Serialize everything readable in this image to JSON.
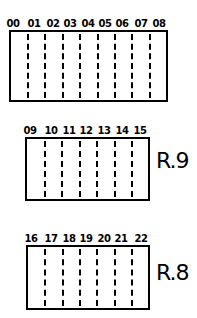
{
  "blocks": [
    {
      "id": "top",
      "box": {
        "left": 9,
        "top": 30,
        "width": 159,
        "height": 72
      },
      "cells": [
        "00",
        "01",
        "02",
        "03",
        "04",
        "05",
        "06",
        "07",
        "08"
      ],
      "label_positions": [
        13,
        34,
        53,
        70,
        88,
        105,
        122,
        141,
        159
      ],
      "dividers": [
        26,
        43,
        61,
        78,
        96,
        113,
        130,
        148
      ],
      "row_label": ""
    },
    {
      "id": "middle",
      "box": {
        "left": 25,
        "top": 137,
        "width": 125,
        "height": 64
      },
      "cells": [
        "09",
        "10",
        "11",
        "12",
        "13",
        "14",
        "15"
      ],
      "label_positions": [
        30,
        51,
        69,
        86,
        104,
        122,
        140
      ],
      "dividers": [
        43,
        60,
        78,
        95,
        113,
        130
      ],
      "row_label": "R.9"
    },
    {
      "id": "bottom",
      "box": {
        "left": 26,
        "top": 245,
        "width": 124,
        "height": 65
      },
      "cells": [
        "16",
        "17",
        "18",
        "19",
        "20",
        "21",
        "22"
      ],
      "label_positions": [
        31,
        51,
        69,
        86,
        104,
        121,
        141
      ],
      "dividers": [
        43,
        61,
        78,
        95,
        113,
        130
      ],
      "row_label": "R.8"
    }
  ],
  "row_labels": {
    "middle": "R.9",
    "bottom": "R.8"
  }
}
